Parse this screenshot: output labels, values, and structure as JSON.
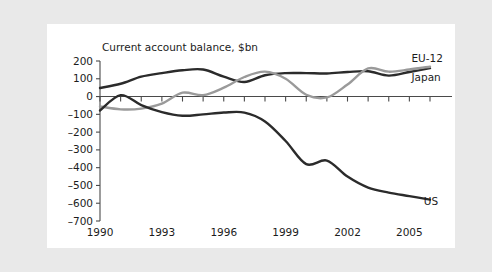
{
  "figure": {
    "background_color": "#e9e9e9",
    "panel_color": "#ffffff"
  },
  "chart_data": {
    "type": "line",
    "title": "Current account balance, $bn",
    "subtitle": "",
    "xlabel": "",
    "ylabel": "",
    "xlim": [
      1990,
      2006
    ],
    "ylim": [
      -700,
      200
    ],
    "grid": false,
    "legend_position": "inline-right",
    "ytick_labels": [
      "200",
      "100",
      "0",
      "-100",
      "-200",
      "-300",
      "-400",
      "-500",
      "-600",
      "-700"
    ],
    "ytick_values": [
      200,
      100,
      0,
      -100,
      -200,
      -300,
      -400,
      -500,
      -600,
      -700
    ],
    "xtick_labels": [
      "1990",
      "1993",
      "1996",
      "1999",
      "2002",
      "2005"
    ],
    "xtick_values": [
      1990,
      1993,
      1996,
      1999,
      2002,
      2005
    ],
    "x": [
      1990,
      1991,
      1992,
      1993,
      1994,
      1995,
      1996,
      1997,
      1998,
      1999,
      2000,
      2001,
      2002,
      2003,
      2004,
      2005,
      2006
    ],
    "series": [
      {
        "name": "Japan",
        "label": "Japan",
        "color": "#2b2b2b",
        "width": 2.4,
        "values": [
          48,
          72,
          112,
          132,
          148,
          152,
          112,
          82,
          120,
          132,
          132,
          130,
          138,
          142,
          118,
          138,
          160
        ]
      },
      {
        "name": "EU-12",
        "label": "EU-12",
        "color": "#9a9a9a",
        "width": 2.4,
        "values": [
          -55,
          -72,
          -68,
          -40,
          22,
          8,
          50,
          110,
          140,
          100,
          10,
          -5,
          68,
          158,
          140,
          152,
          168
        ]
      },
      {
        "name": "US",
        "label": "US",
        "color": "#2b2b2b",
        "width": 2.4,
        "values": [
          -78,
          8,
          -48,
          -88,
          -108,
          -100,
          -90,
          -90,
          -140,
          -250,
          -380,
          -360,
          -450,
          -512,
          -540,
          -560,
          -580
        ]
      }
    ],
    "annotations": [
      {
        "text": "EU-12",
        "x": 2005.1,
        "y": 218
      },
      {
        "text": "Japan",
        "x": 2005.1,
        "y": 108
      },
      {
        "text": "US",
        "x": 2005.7,
        "y": -590
      }
    ]
  }
}
